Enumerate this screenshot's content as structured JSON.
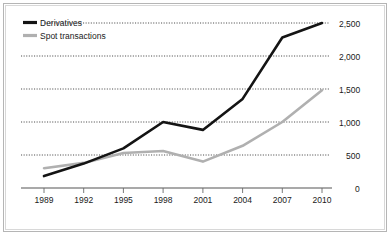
{
  "chart_data": {
    "type": "line",
    "title": "",
    "subtitle": "",
    "xlabel": "",
    "ylabel": "",
    "x": [
      1989,
      1992,
      1995,
      1998,
      2001,
      2004,
      2007,
      2010
    ],
    "x_tick_labels": [
      "1989",
      "1992",
      "1995",
      "1998",
      "2001",
      "2004",
      "2007",
      "2010"
    ],
    "y_tick_values": [
      0,
      500,
      1000,
      1500,
      2000,
      2500
    ],
    "y_tick_labels": [
      "0",
      "500",
      "1,000",
      "1,500",
      "2,000",
      "2,500"
    ],
    "ylim": [
      0,
      2500
    ],
    "xlim": [
      1989,
      2010
    ],
    "grid": "horizontal-dotted",
    "legend_position": "top-left",
    "series": [
      {
        "name": "Derivatives",
        "color": "#141414",
        "values": [
          180,
          370,
          600,
          1000,
          880,
          1350,
          2280,
          2500
        ]
      },
      {
        "name": "Spot transactions",
        "color": "#b0b0b0",
        "values": [
          300,
          380,
          530,
          560,
          400,
          640,
          1000,
          1480
        ]
      }
    ],
    "annotations": []
  },
  "legend": {
    "entries": [
      {
        "label": "Derivatives",
        "swatch": "line-swatch-black"
      },
      {
        "label": "Spot transactions",
        "swatch": "line-swatch-gray"
      }
    ]
  },
  "axes": {
    "x_labels": [
      "1989",
      "1992",
      "1995",
      "1998",
      "2001",
      "2004",
      "2007",
      "2010"
    ],
    "y_labels": [
      "2,500",
      "2,000",
      "1,500",
      "1,000",
      "500",
      "0"
    ]
  }
}
